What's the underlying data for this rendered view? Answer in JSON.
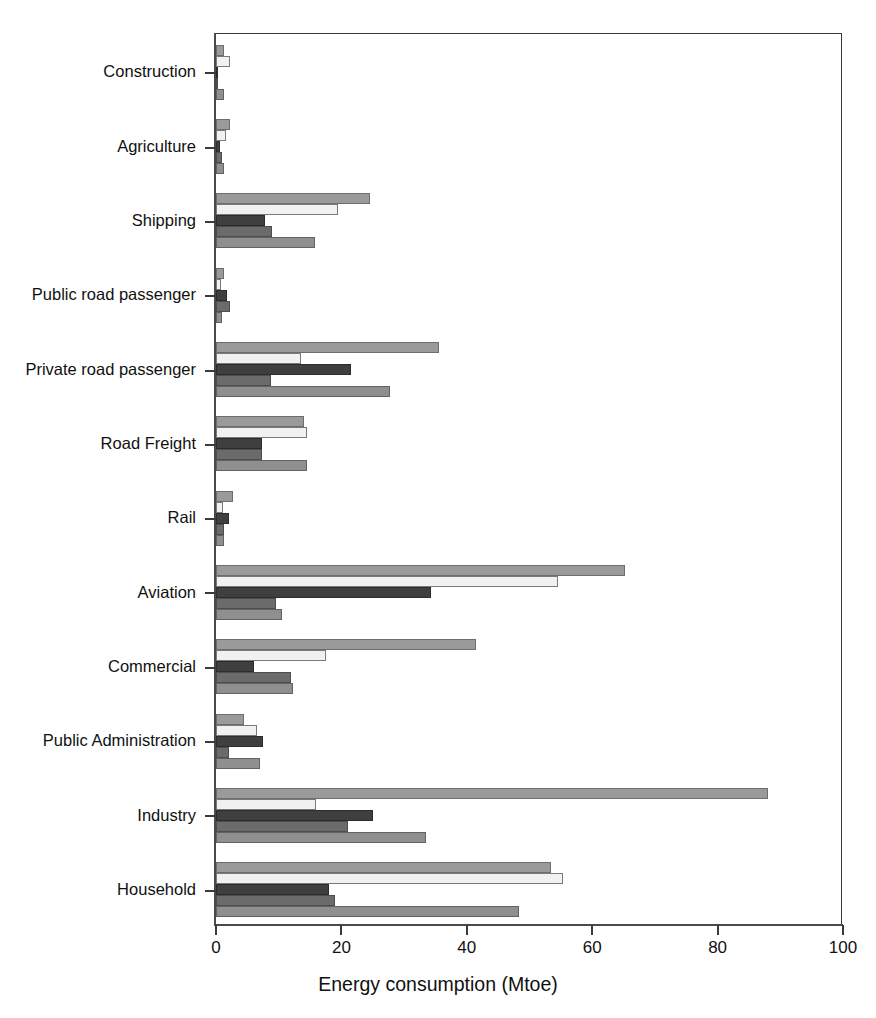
{
  "chart_data": {
    "type": "bar",
    "orientation": "horizontal",
    "title": "",
    "xlabel": "Energy consumption (Mtoe)",
    "ylabel": "",
    "xlim": [
      0,
      100
    ],
    "xticks": [
      0,
      20,
      40,
      60,
      80,
      100
    ],
    "grid": false,
    "legend": "none",
    "categories": [
      "Construction",
      "Agriculture",
      "Shipping",
      "Public road passenger",
      "Private road passenger",
      "Road Freight",
      "Rail",
      "Aviation",
      "Commercial",
      "Public Administration",
      "Industry",
      "Household"
    ],
    "series": [
      {
        "name": "series-1",
        "color": "#9a9a9a",
        "values": [
          1.2,
          2.2,
          24.6,
          1.2,
          35.5,
          14.0,
          2.7,
          65.3,
          41.5,
          4.5,
          88.0,
          53.5
        ]
      },
      {
        "name": "series-2",
        "color": "#f1f1f1",
        "values": [
          2.2,
          1.6,
          19.5,
          0.8,
          13.5,
          14.5,
          1.1,
          54.5,
          17.5,
          6.5,
          16.0,
          55.3
        ]
      },
      {
        "name": "series-3",
        "color": "#3f3f3f",
        "values": [
          0.2,
          0.7,
          7.8,
          1.8,
          21.5,
          7.3,
          2.1,
          34.3,
          6.0,
          7.5,
          25.0,
          18.0
        ]
      },
      {
        "name": "series-4",
        "color": "#6b6b6b",
        "values": [
          0.2,
          1.0,
          9.0,
          2.3,
          8.7,
          7.3,
          1.3,
          9.5,
          12.0,
          2.0,
          21.0,
          19.0
        ]
      },
      {
        "name": "series-5",
        "color": "#8f8f8f",
        "values": [
          1.2,
          1.3,
          15.8,
          0.9,
          27.7,
          14.5,
          1.3,
          10.5,
          12.3,
          7.0,
          33.5,
          48.3
        ]
      }
    ]
  },
  "axis": {
    "x_title": "Energy consumption (Mtoe)",
    "tick_labels": [
      "0",
      "20",
      "40",
      "60",
      "80",
      "100"
    ]
  },
  "category_labels": {
    "0": "Construction",
    "1": "Agriculture",
    "2": "Shipping",
    "3": "Public road passenger",
    "4": "Private road passenger",
    "5": "Road Freight",
    "6": "Rail",
    "7": "Aviation",
    "8": "Commercial",
    "9": "Public Administration",
    "10": "Industry",
    "11": "Household"
  }
}
